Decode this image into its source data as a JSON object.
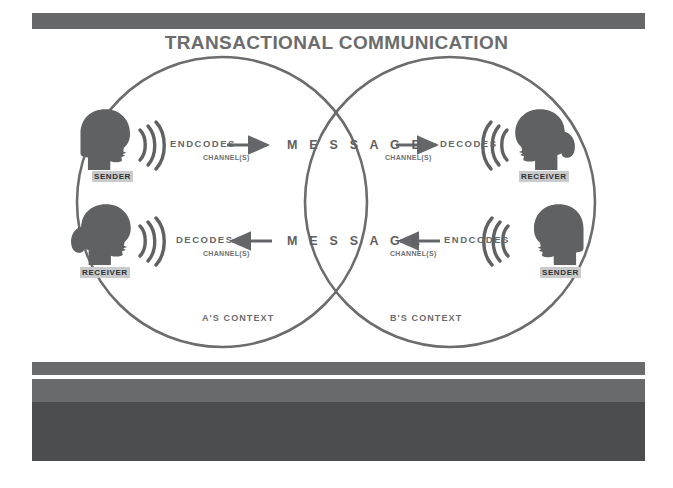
{
  "slide": {
    "title": "TRANSACTIONAL COMMUNICATION",
    "width": 673,
    "height": 488
  },
  "colors": {
    "figure_gray": "#606162",
    "line_gray": "#6b6c6d",
    "bar_gray": "#666768",
    "block_dark": "#4c4d4e",
    "block_light": "#686a6b",
    "label_chip": "#c9cacb",
    "background": "#ffffff"
  },
  "diagram": {
    "left_circle_label": "A'S CONTEXT",
    "right_circle_label": "B'S CONTEXT",
    "message_top": "M E S S A G E",
    "message_bottom": "M E S S A G E",
    "top_flow": {
      "source_role": "SENDER",
      "source_action": "ENDCODES",
      "source_channel": "CHANNEL(S)",
      "target_action": "DECODES",
      "target_channel": "CHANNEL(S)",
      "target_role": "RECEIVER"
    },
    "bottom_flow": {
      "source_role": "SENDER",
      "source_action": "ENDCODES",
      "source_channel": "CHANNEL(S)",
      "target_action": "DECODES",
      "target_channel": "CHANNEL(S)",
      "target_role": "RECEIVER"
    }
  }
}
